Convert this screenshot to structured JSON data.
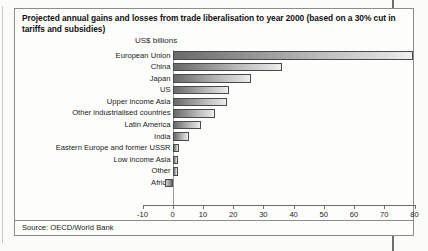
{
  "figure": {
    "title": "Projected annual gains and losses from trade liberalisation to year 2000 (based on a 30% cut in tariffs and subsidies)",
    "unit_label": "US$ billions",
    "source": "Source: OECD/World Bank"
  },
  "chart_data": {
    "type": "bar",
    "orientation": "horizontal",
    "title": "Projected annual gains and losses from trade liberalisation to year 2000 (based on a 30% cut in tariffs and subsidies)",
    "xlabel": "US$ billions",
    "ylabel": "",
    "xlim": [
      -10,
      80
    ],
    "xticks": [
      -10,
      0,
      10,
      20,
      30,
      40,
      50,
      60,
      70,
      80
    ],
    "xticklabels": [
      "-10",
      "0",
      "10",
      "20",
      "30",
      "40",
      "50",
      "60",
      "70",
      "80"
    ],
    "grid": false,
    "legend": false,
    "categories": [
      "European Union",
      "China",
      "Japan",
      "US",
      "Upper income Asia",
      "Other industrialised countries",
      "Latin America",
      "India",
      "Eastern Europe and former USSR",
      "Low income Asia",
      "Other",
      "Africa"
    ],
    "values": [
      79.5,
      36.0,
      26.0,
      18.5,
      18.0,
      14.0,
      9.5,
      5.5,
      2.0,
      1.8,
      1.8,
      -2.7
    ],
    "source": "Source: OECD/World Bank"
  }
}
